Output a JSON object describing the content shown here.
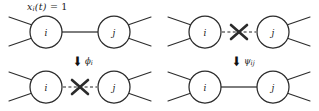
{
  "figure": {
    "caption_label": "x_i(t) = 1",
    "state_label": {
      "var": "x",
      "var_sub": "i",
      "time": "(t)",
      "equals": "=",
      "value": "1"
    },
    "node_i_label": "i",
    "node_j_label": "j",
    "transitions": [
      {
        "id": "node-deactivation",
        "arrow_glyph": "⬇",
        "label": "ϕ",
        "label_sub": "i"
      },
      {
        "id": "edge-restoration",
        "arrow_glyph": "⬇",
        "label": "ψ",
        "label_sub": "ij"
      }
    ],
    "panels": [
      {
        "id": "top-left",
        "edge_state": "present",
        "edge_style": "solid",
        "has_cross": false,
        "node_left": "i",
        "node_right": "j"
      },
      {
        "id": "top-right",
        "edge_state": "absent",
        "edge_style": "dashed",
        "has_cross": true,
        "node_left": "i",
        "node_right": "j"
      },
      {
        "id": "bottom-left",
        "edge_state": "absent",
        "edge_style": "dashed",
        "has_cross": true,
        "node_left": "i",
        "node_right": "j"
      },
      {
        "id": "bottom-right",
        "edge_state": "present",
        "edge_style": "solid",
        "has_cross": false,
        "node_left": "i",
        "node_right": "j"
      }
    ],
    "colors": {
      "node_stroke": "#2b2b2b",
      "edge_solid": "#7d7d7d",
      "edge_dashed": "#6f6f6f",
      "cross": "#2b2b2b",
      "background": "#ffffff"
    }
  }
}
